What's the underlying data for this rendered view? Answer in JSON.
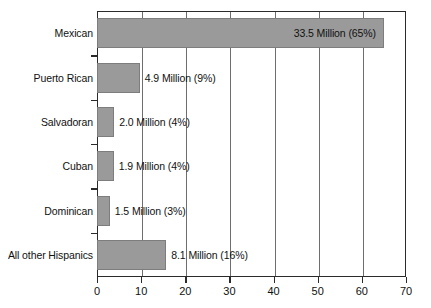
{
  "chart_data": {
    "type": "bar",
    "orientation": "horizontal",
    "title": "",
    "subtitle": "",
    "xlabel": "",
    "ylabel": "",
    "xlim": [
      0,
      70
    ],
    "ylim": null,
    "grid": true,
    "legend": null,
    "xticks": [
      "0",
      "10",
      "20",
      "30",
      "40",
      "50",
      "60",
      "70"
    ],
    "xtick_values": [
      0,
      10,
      20,
      30,
      40,
      50,
      60,
      70
    ],
    "categories": [
      "Mexican",
      "Puerto Rican",
      "Salvadoran",
      "Cuban",
      "Dominican",
      "All other Hispanics"
    ],
    "values": [
      33.5,
      4.9,
      2.0,
      1.9,
      1.5,
      8.1
    ],
    "percents": [
      65,
      9,
      4,
      4,
      3,
      16
    ],
    "bar_labels": [
      "33.5 Million (65%)",
      "4.9 Million (9%)",
      "2.0 Million (4%)",
      "1.9 Million (4%)",
      "1.5 Million (3%)",
      "8.1 Million (16%)"
    ],
    "bar_label_positions": [
      "inside",
      "outside",
      "outside",
      "outside",
      "outside",
      "outside"
    ],
    "bar_pixel_ends": [
      65.0,
      9.7,
      3.9,
      3.8,
      2.9,
      15.7
    ],
    "colors": {
      "bar_fill": "#9a9a9a",
      "bar_stroke": "#7d7d7d",
      "axis": "#2b2b2b",
      "gridline": "#6e6e6e",
      "text": "#111111",
      "background": "#ffffff"
    }
  }
}
